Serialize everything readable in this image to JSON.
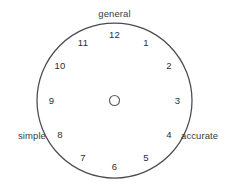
{
  "figure": {
    "type": "clock-dial-diagram",
    "background_color": "#ffffff",
    "stroke_color": "#4a4a50",
    "text_color": "#2e2e32"
  },
  "dial": {
    "center_x": 114.5,
    "center_y": 100.5,
    "radius": 77.5,
    "hub_radius": 5.0,
    "hour_label_radius": 63
  },
  "hours": [
    {
      "value": "12",
      "angle_deg": 0,
      "x": 114.5,
      "y": 34.5
    },
    {
      "value": "1",
      "angle_deg": 30,
      "x": 146.0,
      "y": 43.0
    },
    {
      "value": "2",
      "angle_deg": 60,
      "x": 169.0,
      "y": 66.0
    },
    {
      "value": "3",
      "angle_deg": 90,
      "x": 177.5,
      "y": 100.5
    },
    {
      "value": "4",
      "angle_deg": 120,
      "x": 169.0,
      "y": 135.0
    },
    {
      "value": "5",
      "angle_deg": 150,
      "x": 146.0,
      "y": 158.0
    },
    {
      "value": "6",
      "angle_deg": 180,
      "x": 114.5,
      "y": 166.5
    },
    {
      "value": "7",
      "angle_deg": 210,
      "x": 83.0,
      "y": 158.0
    },
    {
      "value": "8",
      "angle_deg": 240,
      "x": 60.0,
      "y": 135.0
    },
    {
      "value": "9",
      "angle_deg": 270,
      "x": 51.5,
      "y": 100.5
    },
    {
      "value": "10",
      "angle_deg": 300,
      "x": 60.0,
      "y": 66.0
    },
    {
      "value": "11",
      "angle_deg": 330,
      "x": 83.0,
      "y": 43.0
    }
  ],
  "axis_labels": [
    {
      "id": "general",
      "text": "general",
      "position": "top",
      "x": 114.5,
      "y": 14.0
    },
    {
      "id": "simple",
      "text": "simple",
      "position": "left",
      "x": 46.0,
      "y": 136.0
    },
    {
      "id": "accurate",
      "text": "accurate",
      "position": "right",
      "x": 181.0,
      "y": 136.0
    }
  ],
  "chart_data": {
    "type": "scatter",
    "title": "",
    "xlabel": "",
    "ylabel": "",
    "annotations": [
      "general",
      "simple",
      "accurate"
    ],
    "tick_labels": [
      "12",
      "1",
      "2",
      "3",
      "4",
      "5",
      "6",
      "7",
      "8",
      "9",
      "10",
      "11"
    ],
    "grid": false,
    "legend": "none"
  }
}
